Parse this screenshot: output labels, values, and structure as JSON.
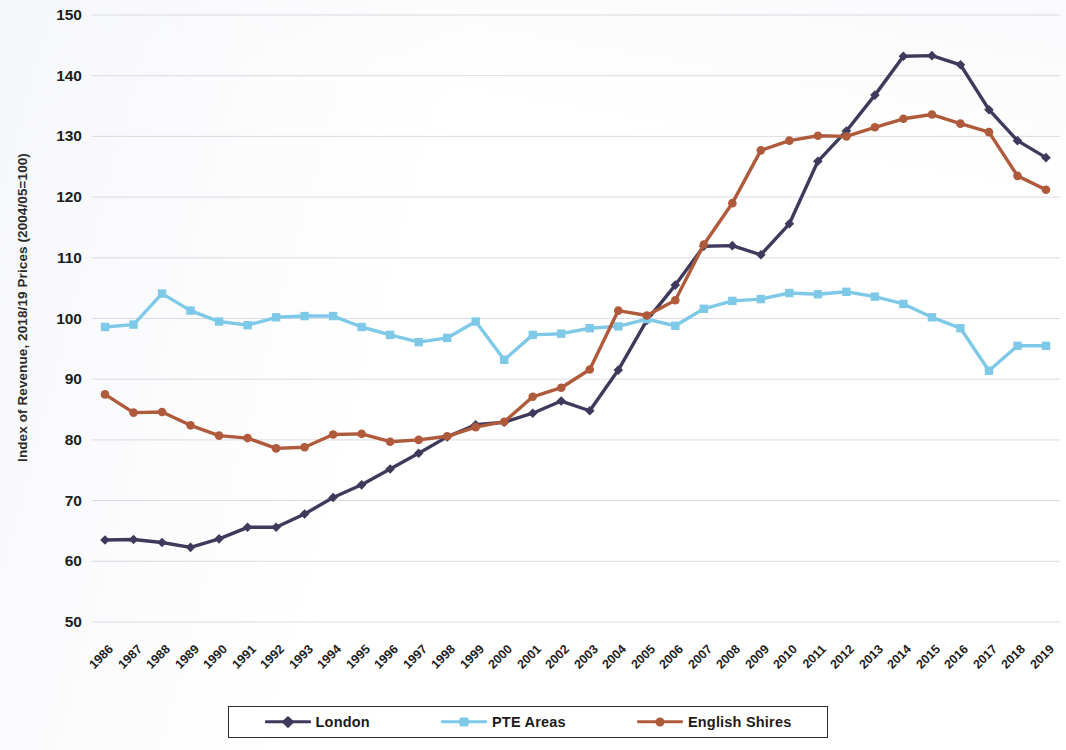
{
  "chart_data": {
    "type": "line",
    "title": "",
    "xlabel": "",
    "ylabel": "Index of Revenue, 2018/19  Prices (2004/05=100)",
    "ylim": [
      50,
      150
    ],
    "ytick_step": 10,
    "yticks": [
      150,
      140,
      130,
      120,
      110,
      100,
      90,
      80,
      70,
      60,
      50
    ],
    "grid": true,
    "grid_axis": "y",
    "legend_position": "bottom",
    "x": [
      1986,
      1987,
      1988,
      1989,
      1990,
      1991,
      1992,
      1993,
      1994,
      1995,
      1996,
      1997,
      1998,
      1999,
      2000,
      2001,
      2002,
      2003,
      2004,
      2005,
      2006,
      2007,
      2008,
      2009,
      2010,
      2011,
      2012,
      2013,
      2014,
      2015,
      2016,
      2017,
      2018,
      2019
    ],
    "categories": [
      "1986",
      "1987",
      "1988",
      "1989",
      "1990",
      "1991",
      "1992",
      "1993",
      "1994",
      "1995",
      "1996",
      "1997",
      "1998",
      "1999",
      "2000",
      "2001",
      "2002",
      "2003",
      "2004",
      "2005",
      "2006",
      "2007",
      "2008",
      "2009",
      "2010",
      "2011",
      "2012",
      "2013",
      "2014",
      "2015",
      "2016",
      "2017",
      "2018",
      "2019"
    ],
    "series": [
      {
        "name": "London",
        "color": "#3D3A5C",
        "marker": "diamond",
        "values": [
          63.5,
          63.6,
          63.1,
          62.3,
          63.7,
          65.6,
          65.6,
          67.8,
          70.5,
          72.6,
          75.2,
          77.8,
          80.5,
          82.5,
          82.9,
          84.4,
          86.4,
          84.8,
          91.5,
          99.7,
          105.5,
          111.9,
          112.0,
          110.5,
          115.6,
          125.9,
          130.9,
          136.8,
          143.2,
          143.3,
          141.8,
          134.4,
          129.3,
          126.5
        ]
      },
      {
        "name": "PTE Areas",
        "color": "#7FC9E8",
        "marker": "square",
        "values": [
          98.6,
          99.0,
          104.1,
          101.3,
          99.5,
          98.9,
          100.2,
          100.4,
          100.4,
          98.6,
          97.3,
          96.1,
          96.8,
          99.5,
          93.2,
          97.3,
          97.5,
          98.4,
          98.7,
          99.9,
          98.8,
          101.6,
          102.9,
          103.2,
          104.2,
          104.0,
          104.4,
          103.6,
          102.4,
          100.2,
          98.4,
          91.4,
          95.5,
          95.5
        ]
      },
      {
        "name": "English Shires",
        "color": "#B05A3C",
        "marker": "circle",
        "values": [
          87.5,
          84.5,
          84.6,
          82.4,
          80.7,
          80.3,
          78.6,
          78.8,
          80.9,
          81.0,
          79.7,
          80.0,
          80.6,
          82.1,
          83.0,
          87.1,
          88.6,
          91.6,
          101.3,
          100.5,
          103.0,
          112.2,
          119.0,
          127.7,
          129.3,
          130.1,
          130.0,
          131.5,
          132.9,
          133.6,
          132.1,
          130.7,
          123.5,
          121.2
        ]
      }
    ]
  },
  "legend": {
    "items": [
      {
        "label": "London"
      },
      {
        "label": "PTE Areas"
      },
      {
        "label": "English Shires"
      }
    ]
  }
}
